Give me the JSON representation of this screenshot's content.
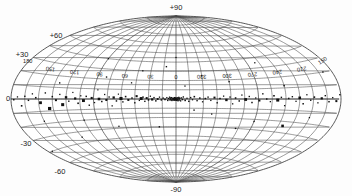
{
  "figure": {
    "name": "all-sky-source-map",
    "projection": "Aitoff",
    "coordinate_system": "Galactic",
    "background_color": "#fdfdfd",
    "grid_color": "#4a4a4a",
    "marker_color": "#111111"
  },
  "latitude_labels": [
    {
      "text": "+90",
      "value": 90
    },
    {
      "text": "+60",
      "value": 60
    },
    {
      "text": "+30",
      "value": 30
    },
    {
      "text": "0",
      "value": 0
    },
    {
      "text": "-30",
      "value": -30
    },
    {
      "text": "-60",
      "value": -60
    },
    {
      "text": "-90",
      "value": -90
    }
  ],
  "longitude_labels": [
    {
      "text": "150",
      "value": 150
    },
    {
      "text": "120",
      "value": 120
    },
    {
      "text": "90",
      "value": 90
    },
    {
      "text": "60",
      "value": 60
    },
    {
      "text": "30",
      "value": 30
    },
    {
      "text": "0",
      "value": 0
    },
    {
      "text": "330",
      "value": 330
    },
    {
      "text": "300",
      "value": 300
    },
    {
      "text": "270",
      "value": 270
    },
    {
      "text": "240",
      "value": 240
    },
    {
      "text": "210",
      "value": 210
    },
    {
      "text": "180",
      "value": 180
    },
    {
      "text": "150",
      "value": 150
    }
  ],
  "chart_data": {
    "type": "scatter",
    "title": "",
    "xlabel": "",
    "ylabel": "",
    "projection": "aitoff",
    "coordinate_system": "galactic",
    "xlim": [
      180,
      -180
    ],
    "ylim": [
      -90,
      90
    ],
    "grid": true,
    "grid_spacing_lon": 15,
    "grid_spacing_lat": 10,
    "legend": null,
    "lon_ticks": [
      150,
      120,
      90,
      60,
      30,
      0,
      330,
      300,
      270,
      240,
      210,
      180
    ],
    "lat_ticks": [
      90,
      60,
      30,
      0,
      -30,
      -60,
      -90
    ],
    "series": [
      {
        "name": "sources",
        "marker": "square",
        "points": [
          {
            "l": 153.0,
            "b": 1.0,
            "size": 1.6
          },
          {
            "l": 148.0,
            "b": -3.0,
            "size": 2.8
          },
          {
            "l": 143.0,
            "b": 5.0,
            "size": 1.4
          },
          {
            "l": 139.0,
            "b": -8.0,
            "size": 3.2
          },
          {
            "l": 135.0,
            "b": 2.0,
            "size": 1.5
          },
          {
            "l": 131.0,
            "b": -1.0,
            "size": 2.0
          },
          {
            "l": 127.0,
            "b": 4.0,
            "size": 1.3
          },
          {
            "l": 124.0,
            "b": -5.0,
            "size": 3.0
          },
          {
            "l": 120.0,
            "b": 1.5,
            "size": 2.4
          },
          {
            "l": 117.0,
            "b": -2.0,
            "size": 1.4
          },
          {
            "l": 113.0,
            "b": 6.0,
            "size": 1.2
          },
          {
            "l": 110.0,
            "b": 0.5,
            "size": 2.2
          },
          {
            "l": 107.0,
            "b": -4.0,
            "size": 1.6
          },
          {
            "l": 104.0,
            "b": 3.0,
            "size": 1.3
          },
          {
            "l": 101.0,
            "b": -1.5,
            "size": 2.9
          },
          {
            "l": 98.0,
            "b": 2.5,
            "size": 1.5
          },
          {
            "l": 95.0,
            "b": -6.0,
            "size": 1.4
          },
          {
            "l": 92.0,
            "b": 1.0,
            "size": 2.1
          },
          {
            "l": 89.0,
            "b": -3.5,
            "size": 1.3
          },
          {
            "l": 86.0,
            "b": 9.0,
            "size": 1.2
          },
          {
            "l": 84.0,
            "b": 0.0,
            "size": 2.6
          },
          {
            "l": 81.0,
            "b": -2.5,
            "size": 1.5
          },
          {
            "l": 78.0,
            "b": 4.5,
            "size": 1.3
          },
          {
            "l": 76.0,
            "b": -1.0,
            "size": 2.0
          },
          {
            "l": 73.0,
            "b": 2.0,
            "size": 1.4
          },
          {
            "l": 70.0,
            "b": -7.0,
            "size": 1.3
          },
          {
            "l": 68.0,
            "b": 1.5,
            "size": 2.3
          },
          {
            "l": 65.0,
            "b": -2.0,
            "size": 1.5
          },
          {
            "l": 63.0,
            "b": 5.0,
            "size": 1.2
          },
          {
            "l": 60.0,
            "b": 0.5,
            "size": 3.1
          },
          {
            "l": 58.0,
            "b": -3.0,
            "size": 1.4
          },
          {
            "l": 55.0,
            "b": 2.5,
            "size": 1.6
          },
          {
            "l": 52.0,
            "b": -1.0,
            "size": 2.0
          },
          {
            "l": 50.0,
            "b": 17.0,
            "size": 1.3
          },
          {
            "l": 48.0,
            "b": 1.0,
            "size": 1.5
          },
          {
            "l": 45.0,
            "b": -4.0,
            "size": 1.4
          },
          {
            "l": 43.0,
            "b": 3.0,
            "size": 2.1
          },
          {
            "l": 40.0,
            "b": -1.5,
            "size": 1.3
          },
          {
            "l": 38.0,
            "b": 0.5,
            "size": 2.9
          },
          {
            "l": 36.0,
            "b": 2.0,
            "size": 1.5
          },
          {
            "l": 34.0,
            "b": -2.5,
            "size": 1.4
          },
          {
            "l": 32.0,
            "b": 1.0,
            "size": 2.0
          },
          {
            "l": 30.0,
            "b": -1.0,
            "size": 1.6
          },
          {
            "l": 28.0,
            "b": 3.0,
            "size": 1.3
          },
          {
            "l": 26.0,
            "b": -0.5,
            "size": 2.2
          },
          {
            "l": 24.0,
            "b": 1.5,
            "size": 1.4
          },
          {
            "l": 22.0,
            "b": -2.0,
            "size": 1.5
          },
          {
            "l": 20.0,
            "b": 0.0,
            "size": 1.8
          },
          {
            "l": 18.0,
            "b": 2.0,
            "size": 1.3
          },
          {
            "l": 16.0,
            "b": -1.0,
            "size": 1.5
          },
          {
            "l": 14.0,
            "b": 1.0,
            "size": 1.4
          },
          {
            "l": 12.0,
            "b": -0.5,
            "size": 1.6
          },
          {
            "l": 10.0,
            "b": 1.5,
            "size": 1.3
          },
          {
            "l": 9.0,
            "b": -1.5,
            "size": 1.5
          },
          {
            "l": 8.0,
            "b": 0.5,
            "size": 1.4
          },
          {
            "l": 7.0,
            "b": 2.0,
            "size": 1.3
          },
          {
            "l": 6.5,
            "b": -1.0,
            "size": 1.5
          },
          {
            "l": 6.0,
            "b": 1.0,
            "size": 1.6
          },
          {
            "l": 5.5,
            "b": -0.5,
            "size": 1.4
          },
          {
            "l": 5.0,
            "b": 1.5,
            "size": 1.3
          },
          {
            "l": 4.5,
            "b": -1.5,
            "size": 1.5
          },
          {
            "l": 4.0,
            "b": 0.0,
            "size": 1.4
          },
          {
            "l": 3.5,
            "b": 1.0,
            "size": 1.3
          },
          {
            "l": 3.0,
            "b": -1.0,
            "size": 1.6
          },
          {
            "l": 2.5,
            "b": 0.5,
            "size": 1.4
          },
          {
            "l": 2.0,
            "b": -0.5,
            "size": 1.5
          },
          {
            "l": 1.8,
            "b": 1.5,
            "size": 1.3
          },
          {
            "l": 1.5,
            "b": -1.2,
            "size": 1.4
          },
          {
            "l": 1.2,
            "b": 0.8,
            "size": 1.5
          },
          {
            "l": 1.0,
            "b": -0.3,
            "size": 1.6
          },
          {
            "l": 0.8,
            "b": 1.2,
            "size": 1.3
          },
          {
            "l": 0.5,
            "b": -1.0,
            "size": 1.5
          },
          {
            "l": 0.3,
            "b": 0.4,
            "size": 1.4
          },
          {
            "l": 0.0,
            "b": -0.5,
            "size": 1.6
          },
          {
            "l": 359.7,
            "b": 1.0,
            "size": 1.4
          },
          {
            "l": 359.4,
            "b": -1.4,
            "size": 1.3
          },
          {
            "l": 359.0,
            "b": 0.6,
            "size": 1.5
          },
          {
            "l": 358.6,
            "b": -0.8,
            "size": 1.4
          },
          {
            "l": 358.2,
            "b": 1.3,
            "size": 1.3
          },
          {
            "l": 357.8,
            "b": -1.8,
            "size": 1.5
          },
          {
            "l": 357.4,
            "b": 0.2,
            "size": 1.4
          },
          {
            "l": 357.0,
            "b": 1.8,
            "size": 1.3
          },
          {
            "l": 356.5,
            "b": -1.0,
            "size": 1.5
          },
          {
            "l": 356.0,
            "b": 0.9,
            "size": 1.6
          },
          {
            "l": 355.0,
            "b": -2.0,
            "size": 1.4
          },
          {
            "l": 354.0,
            "b": 1.2,
            "size": 1.3
          },
          {
            "l": 353.0,
            "b": -0.6,
            "size": 1.5
          },
          {
            "l": 352.0,
            "b": 2.2,
            "size": 1.4
          },
          {
            "l": 350.0,
            "b": -1.5,
            "size": 1.6
          },
          {
            "l": 348.0,
            "b": 0.8,
            "size": 1.3
          },
          {
            "l": 346.0,
            "b": -2.5,
            "size": 1.5
          },
          {
            "l": 344.0,
            "b": 1.5,
            "size": 1.4
          },
          {
            "l": 342.0,
            "b": -0.8,
            "size": 1.3
          },
          {
            "l": 340.0,
            "b": 2.5,
            "size": 1.6
          },
          {
            "l": 337.0,
            "b": -1.8,
            "size": 1.4
          },
          {
            "l": 334.0,
            "b": 1.0,
            "size": 1.5
          },
          {
            "l": 331.0,
            "b": -3.0,
            "size": 1.3
          },
          {
            "l": 328.0,
            "b": 0.5,
            "size": 1.5
          },
          {
            "l": 325.0,
            "b": 2.0,
            "size": 1.4
          },
          {
            "l": 322.0,
            "b": -1.5,
            "size": 1.3
          },
          {
            "l": 318.0,
            "b": 1.5,
            "size": 2.0
          },
          {
            "l": 315.0,
            "b": -4.0,
            "size": 1.4
          },
          {
            "l": 312.0,
            "b": 0.5,
            "size": 1.5
          },
          {
            "l": 308.0,
            "b": 3.0,
            "size": 1.3
          },
          {
            "l": 305.0,
            "b": -1.0,
            "size": 2.4
          },
          {
            "l": 301.0,
            "b": 2.0,
            "size": 1.4
          },
          {
            "l": 298.0,
            "b": -5.0,
            "size": 1.3
          },
          {
            "l": 295.0,
            "b": 1.0,
            "size": 1.6
          },
          {
            "l": 291.0,
            "b": -2.0,
            "size": 1.5
          },
          {
            "l": 288.0,
            "b": 4.0,
            "size": 1.3
          },
          {
            "l": 284.0,
            "b": -0.5,
            "size": 2.8
          },
          {
            "l": 280.0,
            "b": 2.5,
            "size": 1.4
          },
          {
            "l": 277.0,
            "b": -3.5,
            "size": 1.5
          },
          {
            "l": 273.0,
            "b": 1.0,
            "size": 1.3
          },
          {
            "l": 269.0,
            "b": -1.5,
            "size": 2.0
          },
          {
            "l": 265.0,
            "b": 5.0,
            "size": 1.4
          },
          {
            "l": 261.0,
            "b": 0.0,
            "size": 1.5
          },
          {
            "l": 257.0,
            "b": -2.5,
            "size": 1.3
          },
          {
            "l": 253.0,
            "b": 3.0,
            "size": 1.6
          },
          {
            "l": 249.0,
            "b": -1.0,
            "size": 3.0
          },
          {
            "l": 245.0,
            "b": 1.5,
            "size": 1.4
          },
          {
            "l": 241.0,
            "b": -6.0,
            "size": 1.3
          },
          {
            "l": 237.0,
            "b": 0.5,
            "size": 1.5
          },
          {
            "l": 233.0,
            "b": 2.0,
            "size": 1.4
          },
          {
            "l": 229.0,
            "b": -2.0,
            "size": 1.3
          },
          {
            "l": 225.0,
            "b": 1.0,
            "size": 2.6
          },
          {
            "l": 221.0,
            "b": -4.0,
            "size": 1.5
          },
          {
            "l": 217.0,
            "b": 3.5,
            "size": 1.3
          },
          {
            "l": 213.0,
            "b": -1.0,
            "size": 1.4
          },
          {
            "l": 209.0,
            "b": 1.5,
            "size": 1.6
          },
          {
            "l": 205.0,
            "b": -3.0,
            "size": 1.3
          },
          {
            "l": 201.0,
            "b": 0.5,
            "size": 2.2
          },
          {
            "l": 197.0,
            "b": 2.5,
            "size": 1.4
          },
          {
            "l": 193.0,
            "b": -2.0,
            "size": 1.5
          },
          {
            "l": 189.0,
            "b": 1.0,
            "size": 1.3
          },
          {
            "l": 185.0,
            "b": -1.5,
            "size": 2.0
          },
          {
            "l": 181.0,
            "b": 3.0,
            "size": 1.4
          },
          {
            "l": 177.0,
            "b": -0.5,
            "size": 1.5
          },
          {
            "l": 173.0,
            "b": 1.5,
            "size": 1.3
          },
          {
            "l": 169.0,
            "b": -5.0,
            "size": 1.6
          },
          {
            "l": 165.0,
            "b": 2.0,
            "size": 1.4
          },
          {
            "l": 161.0,
            "b": -1.0,
            "size": 1.5
          },
          {
            "l": 157.0,
            "b": 4.0,
            "size": 1.3
          },
          {
            "l": 40.0,
            "b": 30.0,
            "size": 1.3
          },
          {
            "l": 12.0,
            "b": 35.0,
            "size": 1.4
          },
          {
            "l": 330.0,
            "b": 25.0,
            "size": 1.3
          },
          {
            "l": 300.0,
            "b": 18.0,
            "size": 1.4
          },
          {
            "l": 270.0,
            "b": -22.0,
            "size": 1.3
          },
          {
            "l": 240.0,
            "b": 12.0,
            "size": 1.5
          },
          {
            "l": 235.0,
            "b": -24.0,
            "size": 2.6
          },
          {
            "l": 210.0,
            "b": -15.0,
            "size": 1.3
          },
          {
            "l": 190.0,
            "b": 20.0,
            "size": 1.4
          },
          {
            "l": 150.0,
            "b": -18.0,
            "size": 1.3
          },
          {
            "l": 130.0,
            "b": 14.0,
            "size": 1.4
          },
          {
            "l": 105.0,
            "b": -20.0,
            "size": 1.3
          },
          {
            "l": 80.0,
            "b": 22.0,
            "size": 1.4
          },
          {
            "l": 68.0,
            "b": -28.0,
            "size": 1.3
          },
          {
            "l": 20.0,
            "b": -30.0,
            "size": 1.4
          },
          {
            "l": 350.0,
            "b": 14.0,
            "size": 1.3
          },
          {
            "l": 340.0,
            "b": -12.0,
            "size": 1.4
          },
          {
            "l": 320.0,
            "b": -16.0,
            "size": 1.3
          },
          {
            "l": 288.0,
            "b": -30.0,
            "size": 1.4
          },
          {
            "l": 175.0,
            "b": -40.0,
            "size": 1.3
          },
          {
            "l": 90.0,
            "b": 40.0,
            "size": 1.3
          },
          {
            "l": 0.0,
            "b": 45.0,
            "size": 1.3
          },
          {
            "l": 260.0,
            "b": 35.0,
            "size": 1.3
          },
          {
            "l": 120.0,
            "b": -35.0,
            "size": 1.3
          }
        ]
      }
    ]
  }
}
